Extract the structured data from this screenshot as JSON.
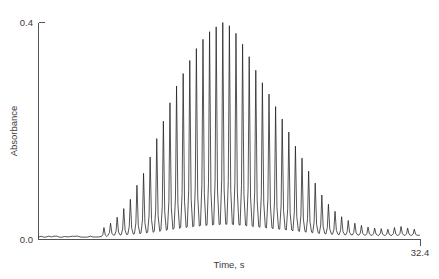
{
  "chart_data": {
    "type": "line",
    "title": "",
    "subtitle": "",
    "xlabel": "Time, s",
    "ylabel": "Absorbance",
    "grid": false,
    "legend": null,
    "xlim": [
      0,
      32.4
    ],
    "ylim": [
      0.0,
      0.4
    ],
    "x_tick_labels": [
      "32.4"
    ],
    "x_tick_values": [
      32.4
    ],
    "y_tick_labels": [
      "0.0",
      "0.4"
    ],
    "y_tick_values": [
      0.0,
      0.4
    ],
    "series": [
      {
        "name": "Absorbance trace",
        "color": "#1c1c1c",
        "peak_spacing_s": 0.56,
        "peak_count": 31,
        "baseline": 0.012,
        "peaks": [
          {
            "t": 5.55,
            "a": 0.022
          },
          {
            "t": 6.11,
            "a": 0.03
          },
          {
            "t": 6.67,
            "a": 0.041
          },
          {
            "t": 7.23,
            "a": 0.057
          },
          {
            "t": 7.79,
            "a": 0.074
          },
          {
            "t": 8.35,
            "a": 0.1
          },
          {
            "t": 8.91,
            "a": 0.122
          },
          {
            "t": 9.47,
            "a": 0.152
          },
          {
            "t": 10.03,
            "a": 0.186
          },
          {
            "t": 10.59,
            "a": 0.218
          },
          {
            "t": 11.15,
            "a": 0.252
          },
          {
            "t": 11.71,
            "a": 0.283
          },
          {
            "t": 12.27,
            "a": 0.306
          },
          {
            "t": 12.83,
            "a": 0.33
          },
          {
            "t": 13.39,
            "a": 0.352
          },
          {
            "t": 13.95,
            "a": 0.369
          },
          {
            "t": 14.51,
            "a": 0.383
          },
          {
            "t": 15.07,
            "a": 0.392
          },
          {
            "t": 15.63,
            "a": 0.4
          },
          {
            "t": 16.19,
            "a": 0.394
          },
          {
            "t": 16.75,
            "a": 0.38
          },
          {
            "t": 17.31,
            "a": 0.36
          },
          {
            "t": 17.87,
            "a": 0.337
          },
          {
            "t": 18.43,
            "a": 0.312
          },
          {
            "t": 18.99,
            "a": 0.289
          },
          {
            "t": 19.55,
            "a": 0.268
          },
          {
            "t": 20.11,
            "a": 0.245
          },
          {
            "t": 20.67,
            "a": 0.222
          },
          {
            "t": 21.23,
            "a": 0.198
          },
          {
            "t": 21.79,
            "a": 0.172
          },
          {
            "t": 22.35,
            "a": 0.15
          },
          {
            "t": 22.91,
            "a": 0.126
          },
          {
            "t": 23.47,
            "a": 0.104
          },
          {
            "t": 24.03,
            "a": 0.082
          },
          {
            "t": 24.59,
            "a": 0.065
          },
          {
            "t": 25.15,
            "a": 0.052
          },
          {
            "t": 25.71,
            "a": 0.042
          },
          {
            "t": 26.27,
            "a": 0.035
          },
          {
            "t": 26.83,
            "a": 0.03
          },
          {
            "t": 27.39,
            "a": 0.026
          },
          {
            "t": 27.95,
            "a": 0.023
          },
          {
            "t": 28.51,
            "a": 0.021
          },
          {
            "t": 29.07,
            "a": 0.02
          },
          {
            "t": 29.63,
            "a": 0.019
          },
          {
            "t": 30.19,
            "a": 0.022
          },
          {
            "t": 30.75,
            "a": 0.024
          },
          {
            "t": 31.31,
            "a": 0.021
          },
          {
            "t": 31.87,
            "a": 0.019
          }
        ]
      }
    ]
  },
  "axes": {
    "y_top_label": "0.4",
    "y_bottom_label": "0.0",
    "x_right_label": "32.4",
    "x_axis_title": "Time, s",
    "y_axis_title": "Absorbance"
  },
  "colors": {
    "trace": "#1c1c1c",
    "spine": "#555555",
    "text": "#3a3a3a",
    "background": "#ffffff"
  }
}
